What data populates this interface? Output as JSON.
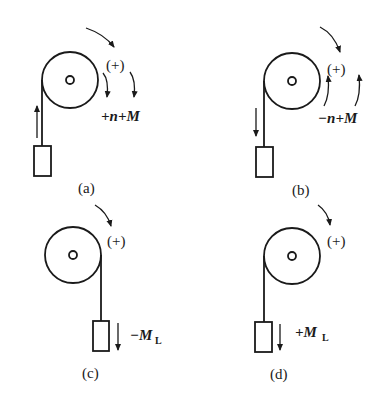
{
  "diagram": {
    "stroke_color": "#1a1a1a",
    "background": "#ffffff",
    "panels": [
      {
        "id": "a",
        "caption": "(a)",
        "positive_label": "(+)",
        "quantity_label": "+n+M",
        "rope_side": "left",
        "load_arrow": "up",
        "quantity_arrows": "down"
      },
      {
        "id": "b",
        "caption": "(b)",
        "positive_label": "(+)",
        "quantity_label": "−n+M",
        "rope_side": "left",
        "load_arrow": "down",
        "quantity_arrows": "up"
      },
      {
        "id": "c",
        "caption": "(c)",
        "positive_label": "(+)",
        "quantity_label_main": "−M",
        "quantity_label_sub": "L",
        "rope_side": "right",
        "load_arrow": "down"
      },
      {
        "id": "d",
        "caption": "(d)",
        "positive_label": "(+)",
        "quantity_label_main": "+M",
        "quantity_label_sub": "L",
        "rope_side": "left",
        "load_arrow": "down"
      }
    ]
  }
}
